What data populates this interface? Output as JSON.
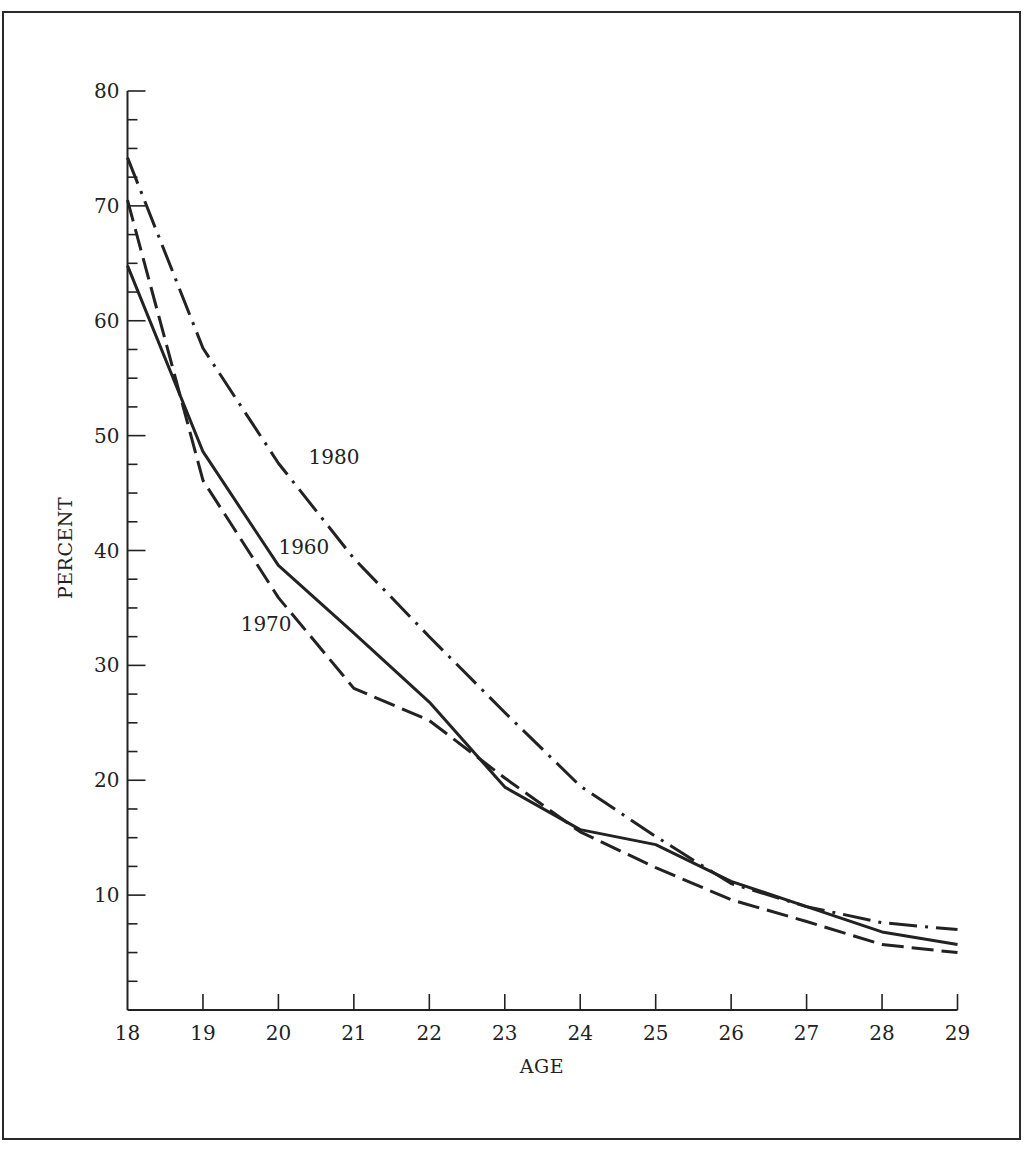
{
  "chart_data": {
    "type": "line",
    "title": "",
    "xlabel": "AGE",
    "ylabel": "PERCENT",
    "x": [
      18,
      19,
      20,
      21,
      22,
      23,
      24,
      25,
      26,
      27,
      28,
      29
    ],
    "xlim": [
      18,
      29
    ],
    "ylim": [
      0,
      80
    ],
    "x_ticks": [
      "18",
      "19",
      "20",
      "21",
      "22",
      "23",
      "24",
      "25",
      "26",
      "27",
      "28",
      "29"
    ],
    "y_ticks": [
      "10",
      "20",
      "30",
      "40",
      "50",
      "60",
      "70",
      "80"
    ],
    "y_minor_step": 2.5,
    "grid": false,
    "legend": "inline labels",
    "series": [
      {
        "name": "1960",
        "style": "solid",
        "values": [
          64.8,
          48.6,
          38.7,
          32.8,
          26.8,
          19.4,
          15.7,
          14.4,
          11.2,
          9.0,
          6.8,
          5.7
        ]
      },
      {
        "name": "1970",
        "style": "dashed",
        "values": [
          70.5,
          46.1,
          35.9,
          28.0,
          25.2,
          20.2,
          15.5,
          12.4,
          9.6,
          7.7,
          5.7,
          5.0
        ]
      },
      {
        "name": "1980",
        "style": "dash-dot",
        "values": [
          74.2,
          57.6,
          47.6,
          39.3,
          32.5,
          25.9,
          19.5,
          15.1,
          11.0,
          9.0,
          7.6,
          7.0
        ]
      }
    ],
    "annotations": [
      {
        "text": "1980",
        "x": 20.4,
        "y": 47.5
      },
      {
        "text": "1960",
        "x": 20.0,
        "y": 39.7
      },
      {
        "text": "1970",
        "x": 19.5,
        "y": 33.0
      }
    ]
  },
  "colors": {
    "line": "#222222",
    "frame": "#2a2a2a",
    "background": "#ffffff"
  }
}
